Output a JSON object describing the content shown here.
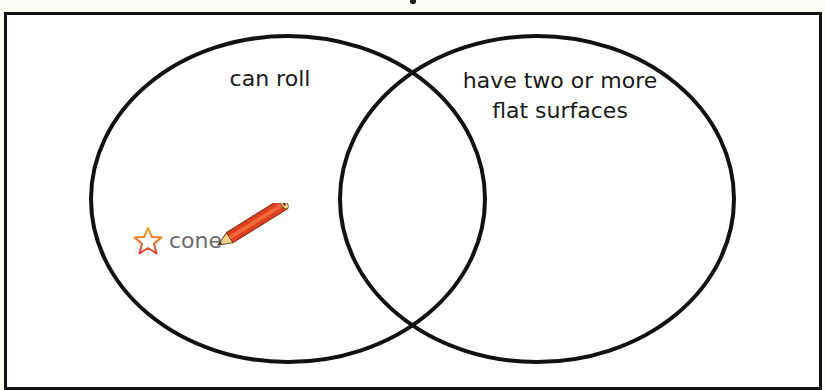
{
  "diagram": {
    "type": "venn",
    "sets": [
      {
        "id": "left",
        "label": "can roll",
        "items": [
          "cone"
        ]
      },
      {
        "id": "right",
        "label_lines": [
          "have two or more",
          "flat surfaces"
        ],
        "items": []
      }
    ],
    "intersection_items": []
  },
  "labels": {
    "left_set": "can roll",
    "right_set_line1": "have two or more",
    "right_set_line2": "flat surfaces"
  },
  "items": {
    "cone": {
      "text": "cone",
      "icon": "star-outline-icon",
      "region": "left-only"
    }
  },
  "annotations": {
    "pencil_icon": "pencil-icon"
  },
  "colors": {
    "outline": "#111111",
    "star": "#e8502a",
    "item_text": "#6b6b6b",
    "pencil_body": "#e0401f",
    "pencil_tip": "#f2d28a"
  }
}
